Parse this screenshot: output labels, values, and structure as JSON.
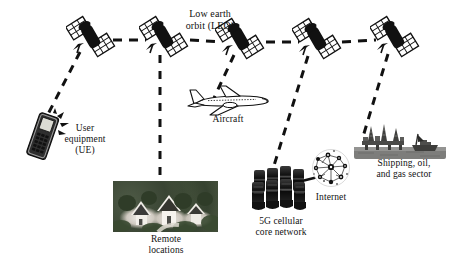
{
  "figure": {
    "background_color": "#ffffff",
    "line_color": "#111111",
    "width": 450,
    "height": 257
  },
  "labels": {
    "leo": "Low earth\norbit (LEO)",
    "user_equipment": "User\nequipment\n(UE)",
    "aircraft": "Aircraft",
    "remote_locations": "Remote\nlocations",
    "core_network": "5G cellular\ncore network",
    "internet": "Internet",
    "shipping": "Shipping, oil,\nand gas sector"
  },
  "satellites": [
    {
      "id": "satellite-1",
      "x": 90,
      "y": 36
    },
    {
      "id": "satellite-2",
      "x": 163,
      "y": 36
    },
    {
      "id": "satellite-3",
      "x": 240,
      "y": 38
    },
    {
      "id": "satellite-4",
      "x": 316,
      "y": 38
    },
    {
      "id": "satellite-5",
      "x": 394,
      "y": 36
    }
  ],
  "ground_nodes": [
    {
      "id": "user-equipment",
      "label": "User equipment (UE)",
      "x": 47,
      "y": 120
    },
    {
      "id": "remote-locations",
      "label": "Remote locations",
      "x": 165,
      "y": 205
    },
    {
      "id": "aircraft",
      "label": "Aircraft",
      "x": 228,
      "y": 105
    },
    {
      "id": "core-network",
      "label": "5G cellular core network",
      "x": 276,
      "y": 190
    },
    {
      "id": "internet",
      "label": "Internet",
      "x": 330,
      "y": 168
    },
    {
      "id": "shipping",
      "label": "Shipping, oil, and gas sector",
      "x": 400,
      "y": 145
    }
  ],
  "links": {
    "inter_satellite": [
      {
        "from": "satellite-1",
        "to": "satellite-2",
        "style": "dashed"
      },
      {
        "from": "satellite-2",
        "to": "satellite-3",
        "style": "dashed"
      },
      {
        "from": "satellite-3",
        "to": "satellite-4",
        "style": "dashed"
      },
      {
        "from": "satellite-4",
        "to": "satellite-5",
        "style": "dashed"
      }
    ],
    "satellite_to_ground": [
      {
        "from": "satellite-1",
        "to": "user-equipment",
        "style": "dashed"
      },
      {
        "from": "satellite-2",
        "to": "remote-locations",
        "style": "dashed"
      },
      {
        "from": "satellite-3",
        "to": "aircraft",
        "style": "dashed"
      },
      {
        "from": "satellite-4",
        "to": "core-network",
        "style": "dashed"
      },
      {
        "from": "satellite-5",
        "to": "shipping",
        "style": "dashed"
      }
    ],
    "ground_links": [
      {
        "from": "core-network",
        "to": "internet",
        "style": "solid"
      }
    ]
  },
  "icons": {
    "satellite": "satellite-icon",
    "phone": "mobile-phone-icon",
    "aircraft": "airplane-icon",
    "village": "village-photo-icon",
    "rack": "server-rack-icon",
    "cloud": "internet-globe-icon",
    "rig": "oil-rig-icon"
  }
}
